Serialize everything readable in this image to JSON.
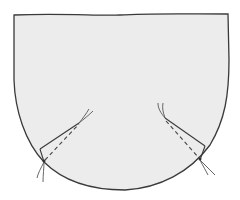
{
  "diagram": {
    "subject": "pocket pattern piece with two darts",
    "colors": {
      "background": "#ffffff",
      "fabric_fill": "#ececec",
      "outline": "#3a3a3a",
      "stitch": "#444444",
      "thread": "#555555"
    },
    "parts": [
      {
        "name": "pocket-body",
        "shape": "flat top, straight sides, rounded bottom"
      },
      {
        "name": "left-dart",
        "style": "dashed stitch line with folded edge and thread tails at both ends"
      },
      {
        "name": "right-dart",
        "style": "dashed stitch line with folded edge and thread tails at both ends"
      }
    ]
  }
}
